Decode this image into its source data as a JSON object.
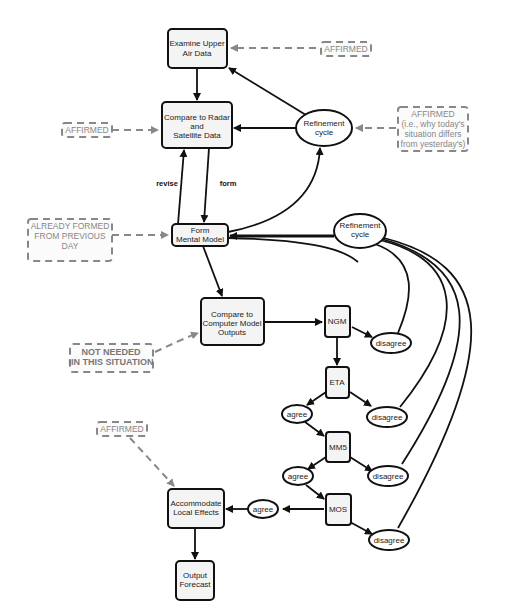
{
  "diagram": {
    "nodes": {
      "examine_upper_air": {
        "line1": "Examine Upper",
        "line2": "Air Data"
      },
      "compare_radar": {
        "line1": "Compare to Radar",
        "line2": "and",
        "line3": "Satellite Data"
      },
      "form_mental_model": {
        "line1": "Form",
        "line2": "Mental Model"
      },
      "compare_computer": {
        "line1": "Compare to",
        "line2": "Computer Model",
        "line3": "Outputs"
      },
      "ngm": "NGM",
      "eta": "ETA",
      "mm5": "MM5",
      "mos": "MOS",
      "accommodate": {
        "line1": "Accommodate",
        "line2": "Local Effects"
      },
      "output_forecast": {
        "line1": "Output",
        "line2": "Forecast"
      },
      "refinement_cycle_1": {
        "line1": "Refinement",
        "line2": "cycle"
      },
      "refinement_cycle_2": {
        "line1": "Refinement",
        "line2": "cycle"
      },
      "disagree_ngm": "disagree",
      "disagree_eta": "disagree",
      "disagree_mm5": "disagree",
      "disagree_mos": "disagree",
      "agree_eta": "agree",
      "agree_mm5": "agree",
      "agree_mos": "agree"
    },
    "edge_labels": {
      "revise": "revise",
      "form": "form"
    },
    "annotations": {
      "affirmed_upper_air": "AFFIRMED",
      "affirmed_radar": "AFFIRMED",
      "affirmed_refinement": {
        "line1": "AFFIRMED",
        "line2": "(i.e., why today's",
        "line3": "situation differs",
        "line4": "from yesterday's)"
      },
      "already_formed": {
        "line1": "ALREADY FORMED",
        "line2": "FROM PREVIOUS",
        "line3": "DAY"
      },
      "not_needed": {
        "line1": "NOT NEEDED",
        "line2": "IIN THIS SITUATION"
      },
      "affirmed_local": "AFFIRMED"
    }
  }
}
